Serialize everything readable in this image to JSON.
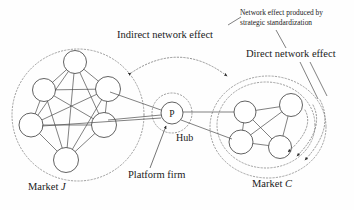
{
  "figure": {
    "type": "network-diagram",
    "background_color": "#fefefe",
    "line_color": "#4a4a4a",
    "dotted_color": "#8a8a8a"
  },
  "labels": {
    "indirect_network_effect": "Indirect network effect",
    "direct_network_effect": "Direct network effect",
    "strategic_standardization_line1": "Network effect produced by",
    "strategic_standardization_line2": "strategic standardization",
    "hub": "Hub",
    "platform_firm": "Platform firm",
    "market_j_prefix": "Market ",
    "market_j_symbol": "J",
    "market_c_prefix": "Market ",
    "market_c_symbol": "C"
  },
  "hub": {
    "node_label": "P",
    "cx": 172,
    "cy": 113,
    "r": 11
  },
  "market_j": {
    "name": "Market J",
    "boundary": {
      "cx": 78,
      "cy": 115,
      "rx": 66,
      "ry": 66
    },
    "nodes": [
      {
        "id": "j1",
        "cx": 75,
        "cy": 62,
        "r": 11.5
      },
      {
        "id": "j2",
        "cx": 44,
        "cy": 90,
        "r": 11.5
      },
      {
        "id": "j3",
        "cx": 108,
        "cy": 89,
        "r": 12.5
      },
      {
        "id": "j4",
        "cx": 31,
        "cy": 125,
        "r": 12
      },
      {
        "id": "j5",
        "cx": 104,
        "cy": 125,
        "r": 12.5
      },
      {
        "id": "j6",
        "cx": 66,
        "cy": 160,
        "r": 12.5
      }
    ],
    "edges": [
      [
        "j1",
        "j2"
      ],
      [
        "j1",
        "j3"
      ],
      [
        "j1",
        "j4"
      ],
      [
        "j1",
        "j5"
      ],
      [
        "j1",
        "j6"
      ],
      [
        "j2",
        "j3"
      ],
      [
        "j2",
        "j4"
      ],
      [
        "j2",
        "j5"
      ],
      [
        "j2",
        "j6"
      ],
      [
        "j3",
        "j4"
      ],
      [
        "j3",
        "j5"
      ],
      [
        "j3",
        "j6"
      ],
      [
        "j4",
        "j5"
      ],
      [
        "j4",
        "j6"
      ],
      [
        "j5",
        "j6"
      ]
    ]
  },
  "market_c": {
    "name": "Market C",
    "boundary_outer": {
      "cx": 268,
      "cy": 127,
      "rx": 58,
      "ry": 51
    },
    "boundary_inner": {
      "cx": 266,
      "cy": 125,
      "rx": 49,
      "ry": 43
    },
    "nodes": [
      {
        "id": "c1",
        "cx": 245,
        "cy": 112,
        "r": 11
      },
      {
        "id": "c2",
        "cx": 291,
        "cy": 105,
        "r": 11.5
      },
      {
        "id": "c3",
        "cx": 241,
        "cy": 142,
        "r": 12
      },
      {
        "id": "c4",
        "cx": 280,
        "cy": 147,
        "r": 11.5
      }
    ],
    "edges": [
      [
        "c1",
        "c2"
      ],
      [
        "c1",
        "c3"
      ],
      [
        "c1",
        "c4"
      ],
      [
        "c2",
        "c3"
      ],
      [
        "c2",
        "c4"
      ],
      [
        "c3",
        "c4"
      ]
    ]
  },
  "hub_connections": {
    "to_market_j": [
      "j3",
      "j5",
      "j5"
    ],
    "to_market_c": [
      "c1",
      "c3"
    ]
  },
  "annotations": {
    "indirect_arc": {
      "from_x": 129,
      "from_y": 72,
      "to_x": 229,
      "to_y": 74,
      "arrowheads": "both"
    },
    "direct_arcs_count": 3,
    "platform_arrow_target_x": 164,
    "platform_arrow_target_y": 124
  }
}
